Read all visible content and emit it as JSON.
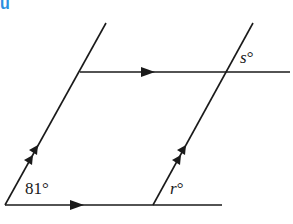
{
  "figure": {
    "type": "parallel-lines-transversals",
    "corner_tag": "u",
    "corner_tag_color": "#2b8fe0",
    "line_color": "#1a1a1a",
    "labels": {
      "angle_bottom_left": "81°",
      "angle_r": "r°",
      "angle_s": "s°",
      "angle_r_var": "r",
      "angle_s_var": "s",
      "degree": "°",
      "angle_81_value": "81"
    },
    "markings": {
      "horizontal_lines_parallel": "single arrow on each horizontal line",
      "slanted_lines_parallel": "double arrow on each slanted line"
    }
  }
}
